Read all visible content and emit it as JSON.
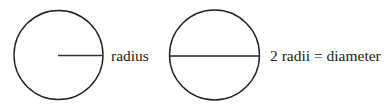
{
  "diagram": {
    "type": "geometry-illustration",
    "stroke_color": "#222222",
    "background": "#ffffff",
    "figures": [
      {
        "id": "circle-radius",
        "shape": "circle",
        "center": [
          58,
          55
        ],
        "radius": 45,
        "segment": "radius",
        "label": "radius"
      },
      {
        "id": "circle-diameter",
        "shape": "circle",
        "center": [
          214,
          55
        ],
        "radius": 45,
        "segment": "diameter",
        "label": "2 radii = diameter"
      }
    ]
  }
}
